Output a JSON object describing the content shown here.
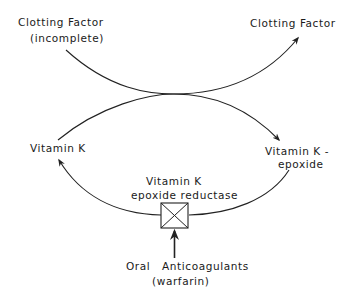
{
  "diagram": {
    "type": "biochemical-cycle",
    "colors": {
      "stroke": "#222222",
      "text": "#1a1a1a",
      "background": "#ffffff"
    },
    "nodes": {
      "clotting_factor_incomplete": {
        "line1": "Clotting Factor",
        "line2": "(incomplete)"
      },
      "clotting_factor": {
        "label": "Clotting Factor"
      },
      "vitamin_k": {
        "label": "Vitamin K"
      },
      "vitamin_k_epoxide": {
        "line1": "Vitamin K -",
        "line2": "epoxide"
      },
      "enzyme": {
        "line1": "Vitamin K",
        "line2": "epoxide reductase",
        "icon": "inhibited-enzyme-box-icon"
      },
      "inhibitor": {
        "line1_a": "Oral",
        "line1_b": "Anticoagulants",
        "line2": "(warfarin)"
      }
    },
    "edges": [
      {
        "from": "Clotting Factor (incomplete)",
        "to": "Clotting Factor"
      },
      {
        "from": "Vitamin K",
        "to": "Vitamin K - epoxide"
      },
      {
        "from": "Vitamin K - epoxide",
        "to": "Vitamin K",
        "via": "Vitamin K epoxide reductase"
      },
      {
        "from": "Oral Anticoagulants (warfarin)",
        "to": "Vitamin K epoxide reductase",
        "kind": "inhibition"
      }
    ]
  }
}
